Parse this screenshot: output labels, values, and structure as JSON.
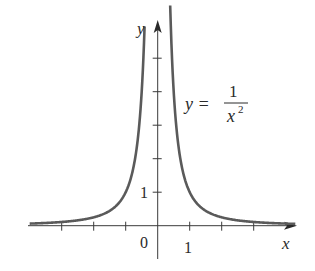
{
  "chart_data": {
    "type": "line",
    "title": "",
    "function": "y = 1/x^2",
    "annotation": {
      "lhs": "y =",
      "numerator": "1",
      "denominator_base": "x",
      "denominator_exponent": "2"
    },
    "xlabel": "x",
    "ylabel": "y",
    "origin_label": "0",
    "x_tick_label": "1",
    "y_tick_label": "1",
    "x_ticks": [
      -3,
      -2,
      -1,
      1,
      2,
      3
    ],
    "y_ticks": [
      1,
      2,
      3,
      4,
      5
    ],
    "xlim": [
      -4.0,
      4.3
    ],
    "ylim": [
      -1.0,
      6.0
    ],
    "grid": false,
    "legend": "none",
    "series": [
      {
        "name": "y = 1/x^2 (left branch)",
        "x": [
          -4.0,
          -3.0,
          -2.0,
          -1.5,
          -1.0,
          -0.75,
          -0.6,
          -0.5,
          -0.45,
          -0.41
        ],
        "y": [
          0.0625,
          0.111,
          0.25,
          0.444,
          1.0,
          1.778,
          2.778,
          4.0,
          4.938,
          5.95
        ]
      },
      {
        "name": "y = 1/x^2 (right branch)",
        "x": [
          0.39,
          0.45,
          0.5,
          0.6,
          0.75,
          1.0,
          1.5,
          2.0,
          3.0,
          4.0
        ],
        "y": [
          6.57,
          4.938,
          4.0,
          2.778,
          1.778,
          1.0,
          0.444,
          0.25,
          0.111,
          0.0625
        ]
      }
    ],
    "colors": {
      "curve": "#5a5a5a",
      "axes": "#3a3a3a",
      "text": "#2a2a2a"
    }
  }
}
